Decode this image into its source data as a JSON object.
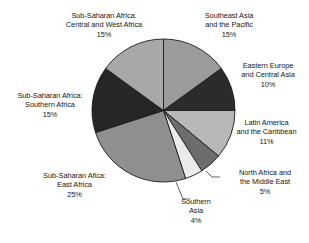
{
  "chart_data": {
    "type": "pie",
    "title": "",
    "subtitle": "",
    "xlabel": "",
    "ylabel": "",
    "legend_position": "outside-labels",
    "grid": false,
    "units": "percent",
    "start_angle_deg": 0,
    "direction": "clockwise",
    "categories": [
      "Southeast Asia and the Pacific",
      "Eastern Europe and Central Asia",
      "Latin America and the Caribbean",
      "North Africa and the Middle East",
      "Southern Asia",
      "Sub-Saharan Afica: East Africa",
      "Sub-Saharan Africa: Southern Africa",
      "Sub-Saharan Africa: Central and West Africa"
    ],
    "values": [
      15,
      10,
      11,
      5,
      4,
      25,
      15,
      15
    ],
    "slice_colors": [
      "#9b9b9b",
      "#2b2b2b",
      "#b8b8b8",
      "#6d6d6d",
      "#ebebeb",
      "#8f8f8f",
      "#262626",
      "#a8a8a8"
    ],
    "slices": [
      {
        "key": "southeast-asia-pacific",
        "label": "Southeast Asia and the Pacific",
        "label_lines": [
          "Southeast Asia",
          "and the Pacific"
        ],
        "value": 15,
        "value_text": "15%",
        "color": "#9b9b9b"
      },
      {
        "key": "eastern-europe-central-asia",
        "label": "Eastern Europe and Central Asia",
        "label_lines": [
          "Eastern Europe",
          "and Central Asia"
        ],
        "value": 10,
        "value_text": "10%",
        "color": "#2b2b2b"
      },
      {
        "key": "latin-america-caribbean",
        "label": "Latin America and the Caribbean",
        "label_lines": [
          "Latin America",
          "and the Caribbean"
        ],
        "value": 11,
        "value_text": "11%",
        "color": "#b8b8b8"
      },
      {
        "key": "north-africa-middle-east",
        "label": "North Africa and the Middle East",
        "label_lines": [
          "North Africa and",
          "the Middle East"
        ],
        "value": 5,
        "value_text": "5%",
        "color": "#6d6d6d"
      },
      {
        "key": "southern-asia",
        "label": "Southern Asia",
        "label_lines": [
          "Southern",
          "Asia"
        ],
        "value": 4,
        "value_text": "4%",
        "color": "#ebebeb"
      },
      {
        "key": "sub-saharan-east-africa",
        "label": "Sub-Saharan Afica: East Africa",
        "label_lines": [
          "Sub-Saharan Afica:",
          "East Africa"
        ],
        "value": 25,
        "value_text": "25%",
        "color": "#8f8f8f"
      },
      {
        "key": "sub-saharan-southern-africa",
        "label": "Sub-Saharan Africa: Southern Africa",
        "label_lines": [
          "Sub-Saharan Africa:",
          "Southern Africa"
        ],
        "value": 15,
        "value_text": "15%",
        "color": "#262626"
      },
      {
        "key": "sub-saharan-central-west-africa",
        "label": "Sub-Saharan Africa: Central and West Africa",
        "label_lines": [
          "Sub-Saharan Africa:",
          "Central and West Africa"
        ],
        "value": 15,
        "value_text": "15%",
        "color": "#a8a8a8"
      }
    ]
  },
  "figure": {
    "background": "#ffffff",
    "outline_color": "#1c1c1c",
    "leader_line_color": "#3a3a3a"
  }
}
